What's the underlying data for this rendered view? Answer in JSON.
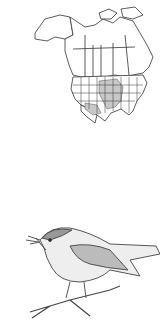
{
  "figure": {
    "map": {
      "description": "Range map of North America",
      "icon": "north-america-range-map",
      "range_color": "#c8c8c8",
      "outline_color": "#333333"
    },
    "illustration": {
      "description": "Engraving of a small songbird perched on a twig holding an insect",
      "icon": "bird-illustration"
    }
  }
}
